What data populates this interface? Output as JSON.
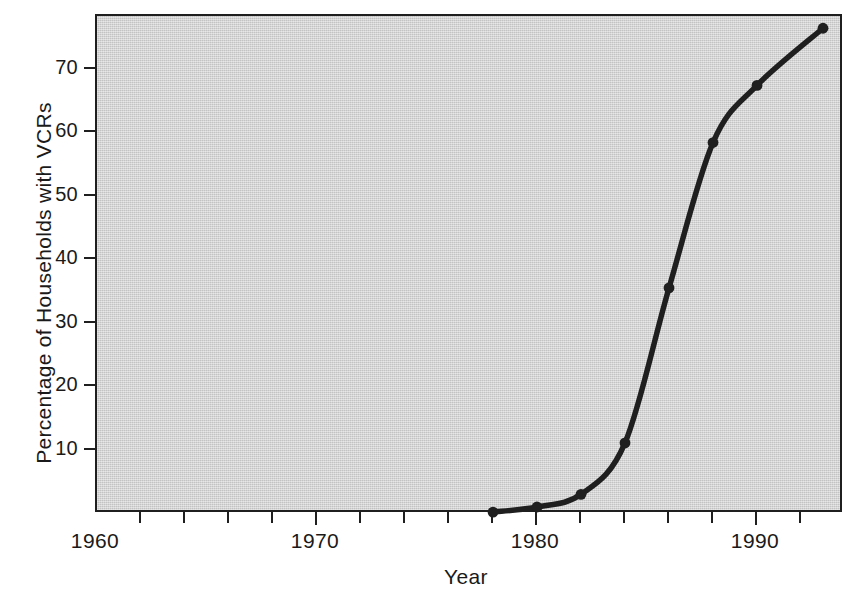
{
  "chart_data": {
    "type": "line",
    "title": "",
    "xlabel": "Year",
    "ylabel": "Percentage of Households with VCRs",
    "xlim": [
      1960,
      1994
    ],
    "ylim": [
      0,
      79
    ],
    "grid": false,
    "legend": "none",
    "marker": "filled-circle",
    "line_color": "#1f1f1f",
    "plot_background": "#d3d3d3",
    "frame_color": "#1f1f1f",
    "x": [
      1978,
      1980,
      1982,
      1984,
      1986,
      1988,
      1990,
      1993
    ],
    "values": [
      0.3,
      1.1,
      3.1,
      11.2,
      35.6,
      58.5,
      67.5,
      76.5
    ],
    "series": [
      {
        "name": "Percentage of Households with VCRs",
        "points": [
          {
            "year": 1978,
            "value": 0.3
          },
          {
            "year": 1980,
            "value": 1.1
          },
          {
            "year": 1982,
            "value": 3.1
          },
          {
            "year": 1984,
            "value": 11.2
          },
          {
            "year": 1986,
            "value": 35.6
          },
          {
            "year": 1988,
            "value": 58.5
          },
          {
            "year": 1990,
            "value": 67.5
          },
          {
            "year": 1993,
            "value": 76.5
          }
        ]
      }
    ],
    "xticks": [
      1960,
      1962,
      1964,
      1966,
      1968,
      1970,
      1972,
      1974,
      1976,
      1978,
      1980,
      1982,
      1984,
      1986,
      1988,
      1990,
      1992
    ],
    "xtick_labels": [
      {
        "value": 1960,
        "label": "1960"
      },
      {
        "value": 1970,
        "label": "1970"
      },
      {
        "value": 1980,
        "label": "1980"
      },
      {
        "value": 1990,
        "label": "1990"
      }
    ],
    "yticks": [
      10,
      20,
      30,
      40,
      50,
      60,
      70
    ],
    "ytick_labels": [
      "10",
      "20",
      "30",
      "40",
      "50",
      "60",
      "70"
    ]
  }
}
